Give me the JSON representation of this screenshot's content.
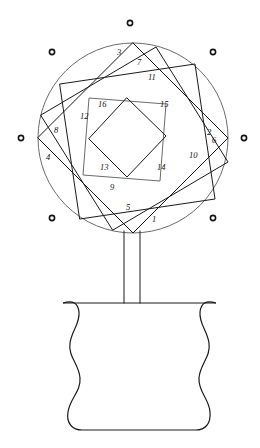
{
  "figure": {
    "canvas": {
      "width": 260,
      "height": 448,
      "background": "#ffffff"
    },
    "ink_color": "#1a1a1a",
    "light_ink_color": "#6b6b6b",
    "circle": {
      "cx": 133,
      "cy": 138,
      "r": 95
    },
    "squares": [
      {
        "index": 1,
        "points": "133,43 228,138 133,233 38,138"
      },
      {
        "index": 2,
        "points": "41,115 156,47 228,162 113,230"
      },
      {
        "index": 3,
        "points": "60,84 195,64 215,199 80,219"
      },
      {
        "index": 4,
        "points": "89,98 166,104 160,181 83,175"
      }
    ],
    "inner_diamond": {
      "points": "127,98 166,136 127,177 89,139"
    },
    "labels": [
      {
        "id": "1",
        "text": "1",
        "x": 152,
        "y": 222
      },
      {
        "id": "2",
        "text": "2",
        "x": 207,
        "y": 135
      },
      {
        "id": "3",
        "text": "3",
        "x": 117,
        "y": 55
      },
      {
        "id": "4",
        "text": "4",
        "x": 46,
        "y": 160
      },
      {
        "id": "5",
        "text": "5",
        "x": 126,
        "y": 210
      },
      {
        "id": "6",
        "text": "6",
        "x": 212,
        "y": 143
      },
      {
        "id": "7",
        "text": "7",
        "x": 137,
        "y": 65
      },
      {
        "id": "8",
        "text": "8",
        "x": 54,
        "y": 133
      },
      {
        "id": "9",
        "text": "9",
        "x": 110,
        "y": 190
      },
      {
        "id": "10",
        "text": "10",
        "x": 189,
        "y": 158
      },
      {
        "id": "11",
        "text": "11",
        "x": 148,
        "y": 80
      },
      {
        "id": "12",
        "text": "12",
        "x": 80,
        "y": 119
      },
      {
        "id": "13",
        "text": "13",
        "x": 100,
        "y": 170
      },
      {
        "id": "14",
        "text": "14",
        "x": 157,
        "y": 170
      },
      {
        "id": "15",
        "text": "15",
        "x": 160,
        "y": 107
      },
      {
        "id": "16",
        "text": "16",
        "x": 98,
        "y": 107
      }
    ],
    "dots": [
      {
        "id": "dot-top",
        "cx": 130,
        "cy": 23,
        "r": 2.6
      },
      {
        "id": "dot-top-left",
        "cx": 52,
        "cy": 52,
        "r": 2.6
      },
      {
        "id": "dot-top-right",
        "cx": 213,
        "cy": 52,
        "r": 2.6
      },
      {
        "id": "dot-left",
        "cx": 21,
        "cy": 138,
        "r": 2.6
      },
      {
        "id": "dot-right",
        "cx": 244,
        "cy": 138,
        "r": 2.6
      },
      {
        "id": "dot-bottom-left",
        "cx": 52,
        "cy": 218,
        "r": 2.6
      },
      {
        "id": "dot-bottom-right",
        "cx": 213,
        "cy": 218,
        "r": 2.6
      }
    ],
    "stem": {
      "left_x": 124,
      "right_x": 140,
      "top_y": 231,
      "bottom_y": 303
    },
    "vase": {
      "outline": "M 63,303 C 73,300 78,303 79,312 C 80,324 72,330 70,343 C 68,357 79,364 80,378 C 81,392 70,398 68,412 C 66,424 73,430 82,430 L 196,430 C 205,430 211,424 210,412 C 209,398 198,392 199,378 C 200,364 211,357 209,343 C 207,330 199,324 200,312 C 201,303 206,300 216,303 L 216,303 L 63,303 Z"
    }
  }
}
